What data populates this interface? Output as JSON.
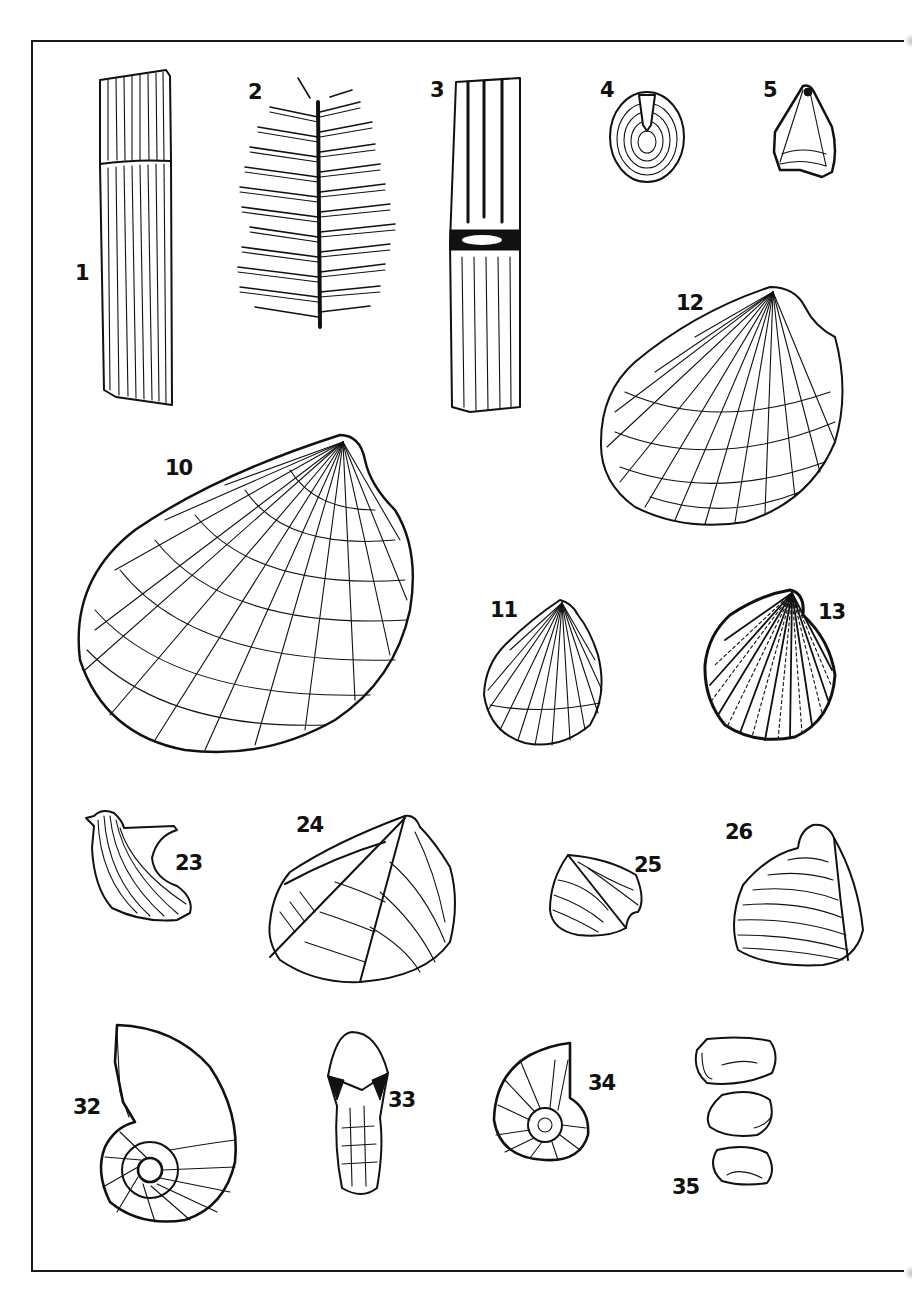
{
  "plate": {
    "background": "#ffffff",
    "ink": "#111111",
    "figures": [
      {
        "id": "1",
        "label": "1",
        "subject": "ribbed plant stem fragment"
      },
      {
        "id": "2",
        "label": "2",
        "subject": "fern / frond leaf"
      },
      {
        "id": "3",
        "label": "3",
        "subject": "jointed ribbed stem (horsetail)"
      },
      {
        "id": "4",
        "label": "4",
        "subject": "concentric disc fossil"
      },
      {
        "id": "5",
        "label": "5",
        "subject": "pyramidal seed / fruit"
      },
      {
        "id": "12",
        "label": "12",
        "subject": "radially ribbed bivalve shell"
      },
      {
        "id": "10",
        "label": "10",
        "subject": "large reticulate bivalve shell"
      },
      {
        "id": "11",
        "label": "11",
        "subject": "ribbed bivalve shell"
      },
      {
        "id": "13",
        "label": "13",
        "subject": "densely ornamented bivalve shell"
      },
      {
        "id": "23",
        "label": "23",
        "subject": "curved ribbed bivalve"
      },
      {
        "id": "24",
        "label": "24",
        "subject": "keeled bivalve shell"
      },
      {
        "id": "25",
        "label": "25",
        "subject": "small keeled bivalve"
      },
      {
        "id": "26",
        "label": "26",
        "subject": "concentrically lined bivalve"
      },
      {
        "id": "32",
        "label": "32",
        "subject": "ammonite / coiled cephalopod"
      },
      {
        "id": "33",
        "label": "33",
        "subject": "belemnite-like club form"
      },
      {
        "id": "34",
        "label": "34",
        "subject": "small ribbed ammonite"
      },
      {
        "id": "35",
        "label": "35",
        "subject": "three ostracod valves"
      }
    ]
  }
}
